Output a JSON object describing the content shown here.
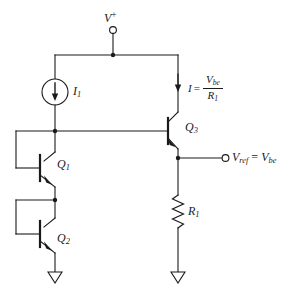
{
  "figure": {
    "type": "circuit-schematic",
    "ink_color": "#1a1a1a",
    "background_color": "#ffffff"
  },
  "labels": {
    "supply": {
      "text": "V",
      "superscript": "+",
      "name": "positive-supply-rail"
    },
    "current_source": {
      "text": "I",
      "subscript": "1",
      "name": "current-source-i1"
    },
    "current_expression": {
      "symbol": "I",
      "equals": "=",
      "numerator": "V",
      "numerator_sub": "be",
      "denominator": "R",
      "denominator_sub": "1"
    },
    "q1": {
      "text": "Q",
      "subscript": "1"
    },
    "q2": {
      "text": "Q",
      "subscript": "2"
    },
    "q3": {
      "text": "Q",
      "subscript": "3"
    },
    "r1": {
      "text": "R",
      "subscript": "1"
    },
    "output": {
      "lhs": "V",
      "lhs_sub": "ref",
      "equals": "=",
      "rhs": "V",
      "rhs_sub": "be"
    }
  },
  "components": [
    {
      "id": "V+",
      "kind": "terminal",
      "label": "V+"
    },
    {
      "id": "I1",
      "kind": "current-source",
      "label": "I1",
      "direction": "down"
    },
    {
      "id": "Q1",
      "kind": "npn-transistor",
      "label": "Q1"
    },
    {
      "id": "Q2",
      "kind": "npn-transistor",
      "label": "Q2"
    },
    {
      "id": "Q3",
      "kind": "npn-transistor",
      "label": "Q3"
    },
    {
      "id": "R1",
      "kind": "resistor",
      "label": "R1"
    },
    {
      "id": "GND1",
      "kind": "ground",
      "label": "ground-left"
    },
    {
      "id": "GND2",
      "kind": "ground",
      "label": "ground-right"
    },
    {
      "id": "VREF",
      "kind": "terminal",
      "label": "Vref = Vbe"
    }
  ]
}
